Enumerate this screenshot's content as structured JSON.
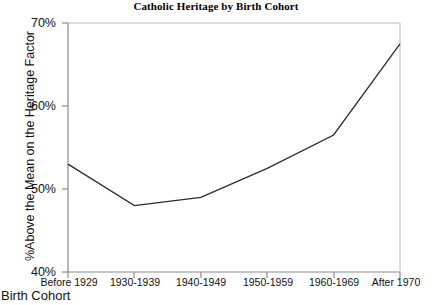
{
  "chart_data": {
    "type": "line",
    "title": "Catholic Heritage by Birth Cohort",
    "xlabel": "Birth Cohort",
    "ylabel": "%Above the Mean on the Heritage Factor",
    "categories": [
      "Before 1929",
      "1930-1939",
      "1940-1949",
      "1950-1959",
      "1960-1969",
      "After 1970"
    ],
    "values": [
      53,
      48,
      49,
      52.5,
      56.5,
      67.5
    ],
    "series": [
      {
        "name": "Catholic Heritage",
        "values": [
          53,
          48,
          49,
          52.5,
          56.5,
          67.5
        ]
      }
    ],
    "ylim": [
      40,
      70
    ],
    "ytick_labels": [
      "40%",
      "50%",
      "60%",
      "70%"
    ],
    "ytick_values": [
      40,
      50,
      60,
      70
    ],
    "grid": false,
    "legend": "none",
    "line_color": "#2b2b2b",
    "axis_color": "#808080",
    "background": "#ffffff"
  }
}
